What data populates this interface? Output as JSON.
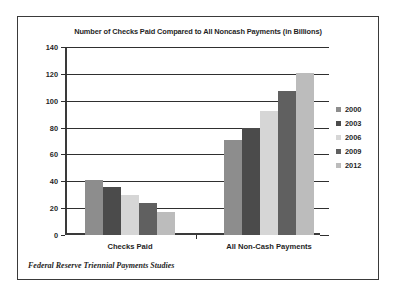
{
  "figure": {
    "title": "Number of Checks Paid Compared to All Noncash Payments (in Billions)",
    "source_note": "Federal Reserve Triennial Payments Studies"
  },
  "legend": {
    "position": "right",
    "entries": [
      {
        "label": "2000",
        "color": "#8d8d8d"
      },
      {
        "label": "2003",
        "color": "#4b4b4b"
      },
      {
        "label": "2006",
        "color": "#d6d6d6"
      },
      {
        "label": "2009",
        "color": "#606060"
      },
      {
        "label": "2012",
        "color": "#bcbcbc"
      }
    ]
  },
  "chart_data": {
    "type": "bar",
    "title": "Number of Checks Paid Compared to All Noncash Payments (in Billions)",
    "xlabel": "",
    "ylabel": "",
    "categories": [
      "Checks Paid",
      "All Non-Cash Payments"
    ],
    "series": [
      {
        "name": "2000",
        "color": "#8d8d8d",
        "values": [
          41,
          71
        ]
      },
      {
        "name": "2003",
        "color": "#4b4b4b",
        "values": [
          36,
          80
        ]
      },
      {
        "name": "2006",
        "color": "#d6d6d6",
        "values": [
          30,
          92
        ]
      },
      {
        "name": "2009",
        "color": "#606060",
        "values": [
          24,
          107
        ]
      },
      {
        "name": "2012",
        "color": "#bcbcbc",
        "values": [
          17,
          121
        ]
      }
    ],
    "ylim": [
      0,
      140
    ],
    "yticks": [
      0,
      20,
      40,
      60,
      80,
      100,
      120,
      140
    ],
    "ytick_labels": [
      "0",
      "20",
      "40",
      "60",
      "80",
      "100",
      "120",
      "140"
    ],
    "grid": true,
    "legend_position": "right",
    "units": "Billions"
  }
}
